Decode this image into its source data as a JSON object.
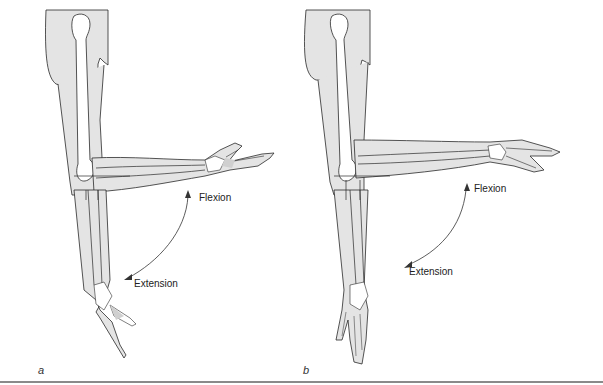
{
  "figure": {
    "panels": [
      {
        "letter": "a",
        "labels": {
          "flexion": "Flexion",
          "extension": "Extension"
        }
      },
      {
        "letter": "b",
        "labels": {
          "flexion": "Flexion",
          "extension": "Extension"
        }
      }
    ],
    "colors": {
      "skin_fill": "#e4e4e4",
      "bone_fill": "#ffffff",
      "outline": "#2a2a2a",
      "arrow": "#333333",
      "rule": "#8a8a8a"
    }
  }
}
